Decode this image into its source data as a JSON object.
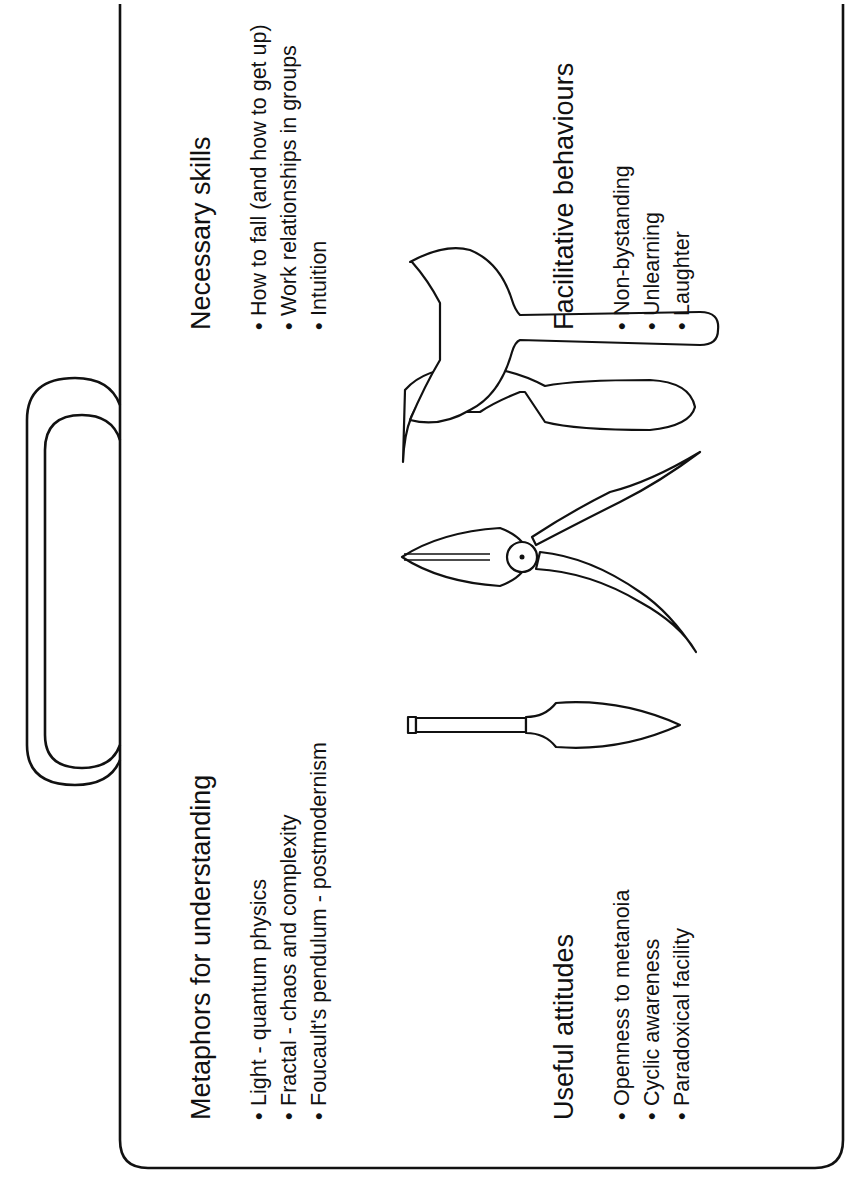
{
  "diagram": {
    "orientation": "rotated 90 degrees counter-clockwise",
    "container": "toolbox",
    "colors": {
      "ink": "#111111",
      "background": "#ffffff"
    },
    "sections": [
      {
        "heading": "Metaphors for understanding",
        "items": [
          "Light - quantum physics",
          "Fractal - chaos and complexity",
          "Foucault's pendulum - postmodernism"
        ]
      },
      {
        "heading": "Necessary skills",
        "items": [
          "How to fall (and how to get up)",
          "Work relationships in groups",
          "Intuition"
        ]
      },
      {
        "heading": "Useful attitudes",
        "items": [
          "Openness to metanoia",
          "Cyclic awareness",
          "Paradoxical facility"
        ]
      },
      {
        "heading": "Facilitative behaviours",
        "items": [
          "Non-bystanding",
          "Unlearning",
          "Laughter"
        ]
      }
    ],
    "tools": [
      "screwdriver",
      "pliers",
      "spanner"
    ],
    "bullet_glyph": "•"
  }
}
